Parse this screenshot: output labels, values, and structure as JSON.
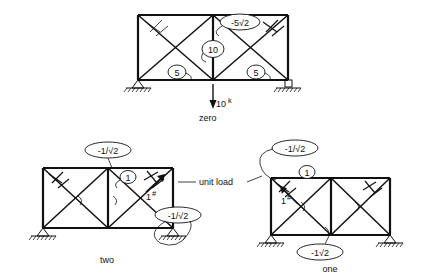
{
  "figure": {
    "title": "",
    "type": "structural-truss-diagram",
    "panels": [
      {
        "id": "top",
        "name": "loaded-truss",
        "caption": "zero",
        "load_label": "10",
        "load_superscript": "k",
        "load_direction": "down",
        "member_force_labels": [
          {
            "value": "5",
            "shape": "circle",
            "position": "bottom-left-diagonal"
          },
          {
            "value": "10",
            "shape": "circle",
            "position": "center-vertical"
          },
          {
            "value": "5",
            "shape": "circle",
            "position": "bottom-right-diagonal"
          },
          {
            "value": "-5√2",
            "shape": "ellipse",
            "position": "top-right-diagonal"
          }
        ],
        "supports": [
          {
            "type": "pin",
            "position": "left"
          },
          {
            "type": "roller",
            "position": "right"
          }
        ]
      },
      {
        "id": "bottom-left",
        "name": "virtual-system-two",
        "caption": "two",
        "unit_load_label": "1",
        "unit_load_superscript": "#",
        "member_force_labels": [
          {
            "value": "-1/√2",
            "shape": "ellipse",
            "position": "top-chord-center"
          },
          {
            "value": "1",
            "shape": "circle",
            "position": "upper-right-diagonal"
          },
          {
            "value": "-1/√2",
            "shape": "ellipse",
            "position": "lower-right-support"
          }
        ],
        "supports": [
          {
            "type": "pin",
            "position": "left"
          },
          {
            "type": "roller",
            "position": "right"
          }
        ]
      },
      {
        "id": "bottom-right",
        "name": "virtual-system-one",
        "caption": "one",
        "unit_load_label": "1",
        "unit_load_superscript": "#",
        "member_force_labels": [
          {
            "value": "-1/√2",
            "shape": "ellipse",
            "position": "top-left-corner"
          },
          {
            "value": "1",
            "shape": "circle",
            "position": "top-chord-left"
          },
          {
            "value": "-1√2",
            "shape": "ellipse",
            "position": "bottom-chord-center"
          }
        ],
        "supports": [
          {
            "type": "pin",
            "position": "left"
          },
          {
            "type": "roller",
            "position": "right"
          }
        ]
      }
    ],
    "annotations": [
      {
        "id": "unit-load-callout",
        "text": "unit load"
      }
    ],
    "colors": {
      "ink": "#111111",
      "background": "#ffffff"
    }
  },
  "labels": {
    "zero": "zero",
    "two": "two",
    "one": "one",
    "unit_load": "unit load",
    "load_10": "10",
    "sup_k": "k",
    "sup_hash": "#",
    "one_digit": "1",
    "five": "5",
    "ten": "10",
    "neg5root2": "-5√2",
    "neg1overroot2": "-1/√2",
    "neg1root2": "-1√2"
  }
}
